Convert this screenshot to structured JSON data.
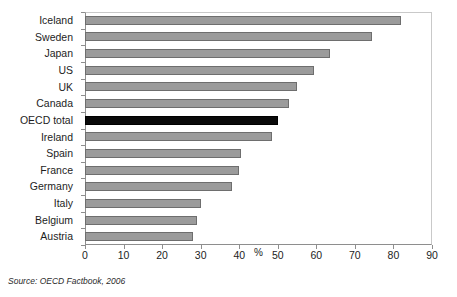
{
  "chart_data": {
    "type": "bar",
    "orientation": "horizontal",
    "title": "",
    "subtitle": "",
    "xlabel": "%",
    "ylabel": "",
    "xlim": [
      0,
      90
    ],
    "xticks": [
      0,
      10,
      20,
      30,
      40,
      50,
      60,
      70,
      80,
      90
    ],
    "xtick_labels": [
      "0",
      "10",
      "20",
      "30",
      "40",
      "50",
      "60",
      "70",
      "80",
      "90"
    ],
    "unit_label": "%",
    "unit_label_position": 45,
    "grid": false,
    "legend": null,
    "categories": [
      "Iceland",
      "Sweden",
      "Japan",
      "US",
      "UK",
      "Canada",
      "OECD total",
      "Ireland",
      "Spain",
      "France",
      "Germany",
      "Italy",
      "Belgium",
      "Austria"
    ],
    "values": [
      82,
      74.5,
      63.5,
      59.5,
      55,
      53,
      50,
      48.5,
      40.5,
      40,
      38,
      30,
      29,
      28
    ],
    "highlight_category": "OECD total",
    "colors": {
      "bar": "#9b9b9b",
      "bar_edge": "#6e6e6e",
      "highlight_bar": "#0a0a0a",
      "highlight_bar_edge": "#000000",
      "axis": "#8e8e8e",
      "frame": "#c9c9c9",
      "text": "#1d1d1d",
      "background": "#ffffff"
    }
  },
  "footer": {
    "source": "Source:  OECD Factbook, 2006"
  }
}
